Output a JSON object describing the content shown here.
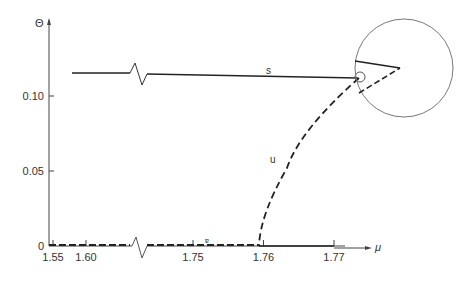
{
  "chart_data": {
    "type": "line",
    "title": "",
    "xlabel": "μ",
    "ylabel": "Θ",
    "ylim": [
      0,
      0.13
    ],
    "x_ticks": [
      "1.55",
      "1.60",
      "1.75",
      "1.76",
      "1.77"
    ],
    "x_tick_values": [
      1.55,
      1.6,
      1.75,
      1.76,
      1.77
    ],
    "y_ticks": [
      "0",
      "0.05",
      "0.10"
    ],
    "y_tick_values": [
      0,
      0.05,
      0.1
    ],
    "axis_break": "broken x-axis between 1.60 and 1.75",
    "series": [
      {
        "name": "s",
        "style": "solid",
        "label": "s",
        "x": [
          1.55,
          1.6,
          1.75,
          1.7667
        ],
        "y": [
          0.115,
          0.115,
          0.114,
          0.112
        ]
      },
      {
        "name": "u",
        "style": "dashed",
        "label": "u",
        "x": [
          1.7585,
          1.759,
          1.7605,
          1.7625,
          1.7645,
          1.7667
        ],
        "y": [
          0.0,
          0.025,
          0.05,
          0.075,
          0.095,
          0.112
        ]
      },
      {
        "name": "trivial-unstable",
        "style": "dashed",
        "x": [
          1.55,
          1.6,
          1.75,
          1.7585
        ],
        "y": [
          0,
          0,
          0,
          0
        ]
      },
      {
        "name": "trivial-stable",
        "style": "solid",
        "x": [
          1.7585,
          1.77
        ],
        "y": [
          0,
          0
        ]
      }
    ],
    "annotations": [
      {
        "text": "s",
        "series": "s"
      },
      {
        "text": "u",
        "series": "u"
      },
      {
        "text": "∘",
        "note": "open circle marking turning point at μ≈1.7667"
      }
    ],
    "inset": {
      "description": "magnified circular inset of the turning point",
      "lines": [
        "solid",
        "dashed"
      ]
    },
    "grid": false,
    "legend": "none"
  }
}
